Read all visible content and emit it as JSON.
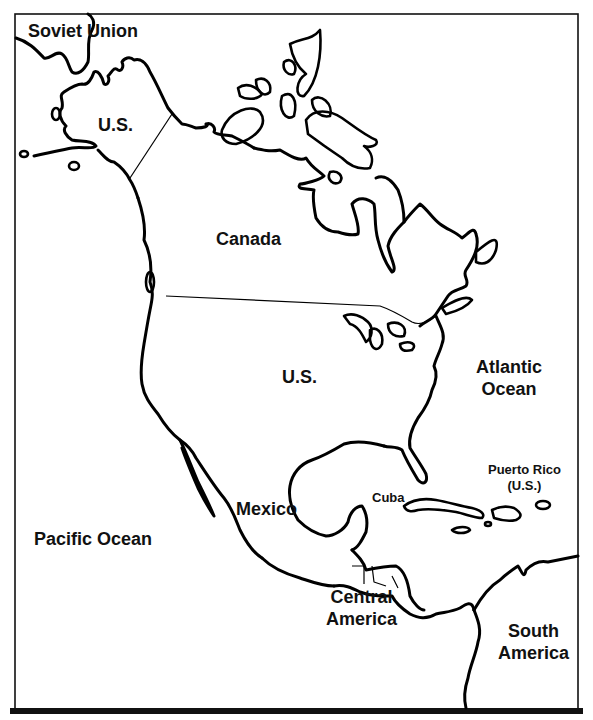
{
  "map": {
    "title": "North America outline map",
    "labels": {
      "soviet_union": "Soviet Union",
      "alaska_us": "U.S.",
      "canada": "Canada",
      "us": "U.S.",
      "atlantic_ocean_line1": "Atlantic",
      "atlantic_ocean_line2": "Ocean",
      "puerto_rico_line1": "Puerto Rico",
      "puerto_rico_line2": "(U.S.)",
      "cuba": "Cuba",
      "mexico": "Mexico",
      "pacific_ocean": "Pacific Ocean",
      "central_america_line1": "Central",
      "central_america_line2": "America",
      "south_america_line1": "South",
      "south_america_line2": "America"
    },
    "colors": {
      "ink": "#000000",
      "background": "#ffffff"
    }
  }
}
